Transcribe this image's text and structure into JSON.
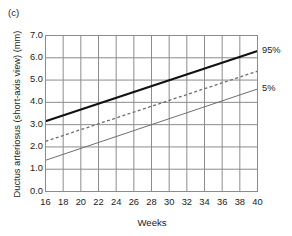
{
  "figure": {
    "panel_label": "(c)",
    "background_color": "#ffffff"
  },
  "chart_data": {
    "type": "line",
    "title": "",
    "subtitle": "",
    "panel": "(c)",
    "xlabel": "Weeks",
    "ylabel": "Ductus arteriosus (short-axis view) (mm)",
    "xlim": [
      16,
      40
    ],
    "ylim": [
      0.0,
      7.0
    ],
    "xticks": [
      16,
      18,
      20,
      22,
      24,
      26,
      28,
      30,
      32,
      34,
      36,
      38,
      40
    ],
    "yticks": [
      0.0,
      1.0,
      2.0,
      3.0,
      4.0,
      5.0,
      6.0,
      7.0
    ],
    "xtick_labels": [
      "16",
      "18",
      "20",
      "22",
      "24",
      "26",
      "28",
      "30",
      "32",
      "34",
      "36",
      "38",
      "40"
    ],
    "ytick_labels": [
      "0.0",
      "1.0",
      "2.0",
      "3.0",
      "4.0",
      "5.0",
      "6.0",
      "7.0"
    ],
    "grid": true,
    "grid_color": "#8c8c8c",
    "legend_position": "right-inline-annotations",
    "x": [
      16,
      40
    ],
    "series": [
      {
        "name": "95%",
        "label": "95%",
        "style": "solid-thick",
        "color": "#111111",
        "width": 2.1,
        "values": [
          3.15,
          6.3
        ]
      },
      {
        "name": "50%",
        "label": "",
        "style": "dashed",
        "color": "#6e6e6e",
        "width": 1.3,
        "values": [
          2.25,
          5.4
        ]
      },
      {
        "name": "5%",
        "label": "5%",
        "style": "solid-thin",
        "color": "#6e6e6e",
        "width": 1.0,
        "values": [
          1.4,
          4.6
        ]
      }
    ],
    "annotations": [
      {
        "text": "95%",
        "x": 40,
        "y": 6.3,
        "position": "right"
      },
      {
        "text": "5%",
        "x": 40,
        "y": 4.6,
        "position": "right"
      }
    ]
  }
}
